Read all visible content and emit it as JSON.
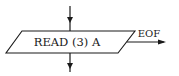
{
  "diagram": {
    "type": "flowchart-fragment",
    "node": {
      "shape": "parallelogram",
      "kind": "input-output",
      "label": "READ (3) A"
    },
    "edges": [
      {
        "name": "incoming",
        "direction": "down",
        "label": ""
      },
      {
        "name": "outgoing",
        "direction": "down",
        "label": ""
      },
      {
        "name": "eof-branch",
        "direction": "right",
        "label": "EOF"
      }
    ],
    "colors": {
      "stroke": "#1a1a1a",
      "background": "#ffffff"
    }
  }
}
